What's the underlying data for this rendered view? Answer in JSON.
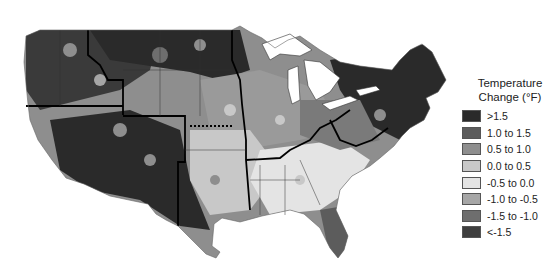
{
  "map": {
    "title": "Temperature Change (°F)",
    "region": "Contiguous United States",
    "land_outline_color": "#000000",
    "water_color": "#ffffff",
    "regions_approx": [
      {
        "name": "Northwest",
        "dominant_class": ">1.5"
      },
      {
        "name": "Southwest",
        "dominant_class": ">1.5"
      },
      {
        "name": "Northern Great Plains",
        "dominant_class": ">1.5"
      },
      {
        "name": "Southern Great Plains",
        "dominant_class": "0.0 to 0.5"
      },
      {
        "name": "Midwest",
        "dominant_class": "0.5 to 1.0"
      },
      {
        "name": "Southeast",
        "dominant_class": "-0.5 to 0.0"
      },
      {
        "name": "Northeast",
        "dominant_class": ">1.5"
      },
      {
        "name": "Florida",
        "dominant_class": "1.0 to 1.5"
      }
    ]
  },
  "legend": {
    "title_line1": "Temperature",
    "title_line2": "Change (°F)",
    "items": [
      {
        "label": ">1.5",
        "color": "#2a2a2a"
      },
      {
        "label": "1.0 to 1.5",
        "color": "#5c5c5c"
      },
      {
        "label": "0.5 to 1.0",
        "color": "#8e8e8e"
      },
      {
        "label": "0.0 to 0.5",
        "color": "#c8c8c8"
      },
      {
        "label": "-0.5 to 0.0",
        "color": "#e4e4e4"
      },
      {
        "label": "-1.0 to -0.5",
        "color": "#a6a6a6"
      },
      {
        "label": "-1.5 to -1.0",
        "color": "#6e6e6e"
      },
      {
        "label": "<-1.5",
        "color": "#3e3e3e"
      }
    ]
  }
}
